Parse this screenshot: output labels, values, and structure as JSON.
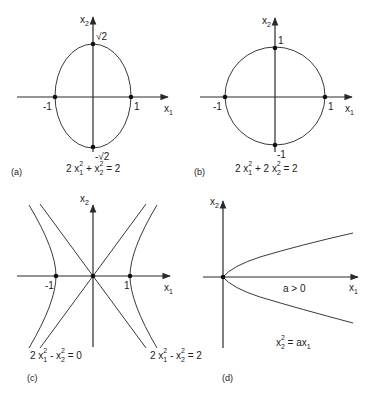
{
  "figure": {
    "panels": [
      {
        "id": "a",
        "tag": "(a)",
        "x_axis_label": "x",
        "x_axis_sub": "1",
        "y_axis_label": "x",
        "y_axis_sub": "2",
        "tick_labels": {
          "left": "-1",
          "right": "1",
          "top": "√2",
          "bottom": "-√2"
        },
        "equation": {
          "parts": [
            "2 x",
            "1",
            "2",
            " + x",
            "2",
            "2",
            " = 2"
          ]
        },
        "curve": "ellipse",
        "equation_text": "2x1^2 + x2^2 = 2"
      },
      {
        "id": "b",
        "tag": "(b)",
        "x_axis_label": "x",
        "x_axis_sub": "1",
        "y_axis_label": "x",
        "y_axis_sub": "2",
        "tick_labels": {
          "left": "-1",
          "right": "1",
          "top": "1",
          "bottom": "-1"
        },
        "equation_text": "2x1^2 + 2x2^2 = 2",
        "curve": "circle"
      },
      {
        "id": "c",
        "tag": "(c)",
        "x_axis_label": "x",
        "x_axis_sub": "1",
        "y_axis_label": "x",
        "y_axis_sub": "2",
        "tick_labels": {
          "left": "-1",
          "right": "1"
        },
        "equations": [
          "2x1^2 - x2^2 = 0",
          "2x1^2 - x2^2 = 2"
        ],
        "curve": "hyperbola and asymptotes"
      },
      {
        "id": "d",
        "tag": "(d)",
        "x_axis_label": "x",
        "x_axis_sub": "1",
        "y_axis_label": "x",
        "y_axis_sub": "2",
        "condition": "a > 0",
        "equation_text": "x2^2 = ax1",
        "curve": "parabola"
      }
    ]
  },
  "text": {
    "x": "x",
    "s1": "1",
    "s2": "2",
    "a_tag": "(a)",
    "b_tag": "(b)",
    "c_tag": "(c)",
    "d_tag": "(d)",
    "neg1": "-1",
    "one": "1",
    "sqrt2": "√2",
    "negsqrt2": "-√2",
    "two": "2",
    "eq_a_1": "2 x",
    "eq_a_2": " + x",
    "eq_end": " = 2",
    "eq_b_2": " + 2 x",
    "eq_c_2": " - x",
    "eq_zero": " = 0",
    "a_gt_0": "a > 0",
    "eq_d_1": "x",
    "eq_d_2": " = ax"
  }
}
